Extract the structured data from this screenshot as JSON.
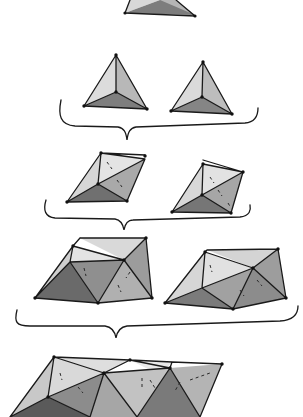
{
  "figure": {
    "levels": [
      {
        "level": 1,
        "items": [
          "single tetrahedron (cut off at top)"
        ]
      },
      {
        "level": 2,
        "items": [
          "tetrahedron",
          "tetrahedron"
        ]
      },
      {
        "level": 3,
        "items": [
          "two-tetrahedra cluster",
          "two-tetrahedra cluster"
        ]
      },
      {
        "level": 4,
        "items": [
          "four-tetrahedra cluster",
          "four-tetrahedra cluster"
        ]
      },
      {
        "level": 5,
        "items": [
          "eight-tetrahedra strip (cut off at bottom)"
        ]
      }
    ],
    "braces": 3,
    "colors": {
      "background": "#ffffff",
      "ink": "#1a1a1a",
      "shade_light": "#d9d9d9",
      "shade_mid": "#a8a8a8",
      "shade_dark": "#6e6e6e"
    }
  }
}
